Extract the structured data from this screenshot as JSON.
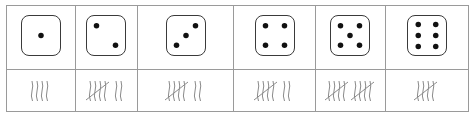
{
  "table": {
    "columns": [
      {
        "face": 1,
        "tally_count": 4,
        "pips": [
          [
            0.5,
            0.5
          ]
        ]
      },
      {
        "face": 2,
        "tally_count": 7,
        "pips": [
          [
            0.25,
            0.25
          ],
          [
            0.75,
            0.75
          ]
        ]
      },
      {
        "face": 3,
        "tally_count": 7,
        "pips": [
          [
            0.25,
            0.75
          ],
          [
            0.5,
            0.5
          ],
          [
            0.75,
            0.25
          ]
        ]
      },
      {
        "face": 4,
        "tally_count": 7,
        "pips": [
          [
            0.25,
            0.25
          ],
          [
            0.75,
            0.25
          ],
          [
            0.25,
            0.75
          ],
          [
            0.75,
            0.75
          ]
        ]
      },
      {
        "face": 5,
        "tally_count": 10,
        "pips": [
          [
            0.25,
            0.25
          ],
          [
            0.75,
            0.25
          ],
          [
            0.5,
            0.5
          ],
          [
            0.25,
            0.75
          ],
          [
            0.75,
            0.75
          ]
        ]
      },
      {
        "face": 6,
        "tally_count": 5,
        "pips": [
          [
            0.27,
            0.22
          ],
          [
            0.73,
            0.22
          ],
          [
            0.27,
            0.5
          ],
          [
            0.73,
            0.5
          ],
          [
            0.27,
            0.78
          ],
          [
            0.73,
            0.78
          ]
        ]
      }
    ],
    "column_widths": [
      68,
      62,
      96,
      81,
      69,
      83
    ]
  },
  "colors": {
    "grid": "#9a9a9a",
    "die_border": "#3a3a3a",
    "pip": "#111111",
    "tally": "#8a8a8a"
  }
}
